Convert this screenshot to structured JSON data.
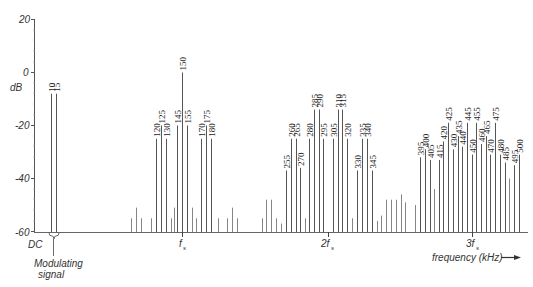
{
  "chart_data": {
    "type": "bar",
    "title": "",
    "xlabel": "frequency (kHz)",
    "ylabel": "dB",
    "ylim": [
      -60,
      20
    ],
    "yticks": [
      20,
      0,
      -20,
      -40,
      -60
    ],
    "x_markers": [
      "DC",
      "fs",
      "2fs",
      "3fs"
    ],
    "annotation": "Modulating signal",
    "grid": false,
    "series": [
      {
        "name": "Modulating signal",
        "points": [
          {
            "x": 10,
            "y": -8,
            "label": "10"
          },
          {
            "x": 15,
            "y": -8,
            "label": "15"
          }
        ]
      },
      {
        "name": "Sidebands around fs",
        "points": [
          {
            "x": 120,
            "y": -25,
            "label": "120"
          },
          {
            "x": 125,
            "y": -20,
            "label": "125"
          },
          {
            "x": 130,
            "y": -25,
            "label": "130"
          },
          {
            "x": 145,
            "y": -20,
            "label": "145"
          },
          {
            "x": 150,
            "y": 0,
            "label": "150"
          },
          {
            "x": 155,
            "y": -20,
            "label": "155"
          },
          {
            "x": 170,
            "y": -25,
            "label": "170"
          },
          {
            "x": 175,
            "y": -20,
            "label": "175"
          },
          {
            "x": 180,
            "y": -25,
            "label": "180"
          }
        ]
      },
      {
        "name": "Sidebands around 2fs",
        "points": [
          {
            "x": 255,
            "y": -37,
            "label": "255"
          },
          {
            "x": 260,
            "y": -25,
            "label": "260"
          },
          {
            "x": 265,
            "y": -25,
            "label": "265"
          },
          {
            "x": 270,
            "y": -36,
            "label": "270"
          },
          {
            "x": 280,
            "y": -25,
            "label": "280"
          },
          {
            "x": 285,
            "y": -14,
            "label": "285"
          },
          {
            "x": 290,
            "y": -14,
            "label": "290"
          },
          {
            "x": 295,
            "y": -25,
            "label": "295"
          },
          {
            "x": 305,
            "y": -25,
            "label": "305"
          },
          {
            "x": 310,
            "y": -14,
            "label": "310"
          },
          {
            "x": 315,
            "y": -14,
            "label": "315"
          },
          {
            "x": 320,
            "y": -25,
            "label": "320"
          },
          {
            "x": 330,
            "y": -37,
            "label": "330"
          },
          {
            "x": 335,
            "y": -25,
            "label": "335"
          },
          {
            "x": 340,
            "y": -25,
            "label": "340"
          },
          {
            "x": 345,
            "y": -37,
            "label": "345"
          }
        ]
      },
      {
        "name": "Sidebands around 3fs",
        "points": [
          {
            "x": 395,
            "y": -32,
            "label": "395"
          },
          {
            "x": 400,
            "y": -29,
            "label": "400"
          },
          {
            "x": 405,
            "y": -33,
            "label": "405"
          },
          {
            "x": 415,
            "y": -33,
            "label": "415"
          },
          {
            "x": 420,
            "y": -26,
            "label": "420"
          },
          {
            "x": 425,
            "y": -19,
            "label": "425"
          },
          {
            "x": 430,
            "y": -29,
            "label": "430"
          },
          {
            "x": 435,
            "y": -24,
            "label": "435"
          },
          {
            "x": 440,
            "y": -28,
            "label": "440"
          },
          {
            "x": 445,
            "y": -19,
            "label": "445"
          },
          {
            "x": 450,
            "y": -31,
            "label": "450"
          },
          {
            "x": 455,
            "y": -19,
            "label": "455"
          },
          {
            "x": 460,
            "y": -27,
            "label": "460"
          },
          {
            "x": 465,
            "y": -24,
            "label": "465"
          },
          {
            "x": 470,
            "y": -31,
            "label": "470"
          },
          {
            "x": 475,
            "y": -19,
            "label": "475"
          },
          {
            "x": 480,
            "y": -31,
            "label": "480"
          },
          {
            "x": 485,
            "y": -34,
            "label": "485"
          },
          {
            "x": 495,
            "y": -35,
            "label": "495"
          },
          {
            "x": 500,
            "y": -31,
            "label": "500"
          }
        ]
      }
    ],
    "minor_components_note": "unlabeled low-level lines between -60 and -46 dB throughout"
  },
  "render": {
    "labeled": [
      {
        "px": 51,
        "dB": -8,
        "t": "10"
      },
      {
        "px": 56,
        "dB": -8,
        "t": "15"
      },
      {
        "px": 156,
        "dB": -25,
        "t": "120"
      },
      {
        "px": 161,
        "dB": -20,
        "t": "125"
      },
      {
        "px": 166,
        "dB": -25,
        "t": "130"
      },
      {
        "px": 177,
        "dB": -20,
        "t": "145"
      },
      {
        "px": 182,
        "dB": 0,
        "t": "150"
      },
      {
        "px": 187,
        "dB": -20,
        "t": "155"
      },
      {
        "px": 201,
        "dB": -25,
        "t": "170"
      },
      {
        "px": 206,
        "dB": -20,
        "t": "175"
      },
      {
        "px": 211,
        "dB": -25,
        "t": "180"
      },
      {
        "px": 286,
        "dB": -37,
        "t": "255"
      },
      {
        "px": 291,
        "dB": -25,
        "t": "260"
      },
      {
        "px": 296,
        "dB": -25,
        "t": "265"
      },
      {
        "px": 300,
        "dB": -36,
        "t": "270"
      },
      {
        "px": 309,
        "dB": -25,
        "t": "280"
      },
      {
        "px": 314,
        "dB": -14,
        "t": "285"
      },
      {
        "px": 319,
        "dB": -14,
        "t": "290"
      },
      {
        "px": 323,
        "dB": -25,
        "t": "295"
      },
      {
        "px": 333,
        "dB": -25,
        "t": "305"
      },
      {
        "px": 338,
        "dB": -14,
        "t": "310"
      },
      {
        "px": 342,
        "dB": -14,
        "t": "315"
      },
      {
        "px": 347,
        "dB": -25,
        "t": "320"
      },
      {
        "px": 357,
        "dB": -37,
        "t": "330"
      },
      {
        "px": 362,
        "dB": -25,
        "t": "335"
      },
      {
        "px": 367,
        "dB": -25,
        "t": "340"
      },
      {
        "px": 372,
        "dB": -37,
        "t": "345"
      },
      {
        "px": 420,
        "dB": -32,
        "t": "395"
      },
      {
        "px": 425,
        "dB": -29,
        "t": "400"
      },
      {
        "px": 430,
        "dB": -33,
        "t": "405"
      },
      {
        "px": 439,
        "dB": -33,
        "t": "415"
      },
      {
        "px": 443,
        "dB": -26,
        "t": "420"
      },
      {
        "px": 448,
        "dB": -19,
        "t": "425"
      },
      {
        "px": 453,
        "dB": -29,
        "t": "430"
      },
      {
        "px": 458,
        "dB": -24,
        "t": "435"
      },
      {
        "px": 462,
        "dB": -28,
        "t": "440"
      },
      {
        "px": 467,
        "dB": -19,
        "t": "445"
      },
      {
        "px": 472,
        "dB": -31,
        "t": "450"
      },
      {
        "px": 476,
        "dB": -19,
        "t": "455"
      },
      {
        "px": 481,
        "dB": -27,
        "t": "460"
      },
      {
        "px": 486,
        "dB": -24,
        "t": "465"
      },
      {
        "px": 490,
        "dB": -31,
        "t": "470"
      },
      {
        "px": 495,
        "dB": -19,
        "t": "475"
      },
      {
        "px": 500,
        "dB": -31,
        "t": "480"
      },
      {
        "px": 505,
        "dB": -34,
        "t": "485"
      },
      {
        "px": 514,
        "dB": -35,
        "t": "495"
      },
      {
        "px": 519,
        "dB": -31,
        "t": "500"
      }
    ],
    "minor": [
      {
        "px": 131,
        "dB": -55
      },
      {
        "px": 136,
        "dB": -51
      },
      {
        "px": 141,
        "dB": -55
      },
      {
        "px": 151,
        "dB": -55
      },
      {
        "px": 171,
        "dB": -55
      },
      {
        "px": 174,
        "dB": -51
      },
      {
        "px": 192,
        "dB": -51
      },
      {
        "px": 196,
        "dB": -55
      },
      {
        "px": 218,
        "dB": -55
      },
      {
        "px": 227,
        "dB": -55
      },
      {
        "px": 232,
        "dB": -51
      },
      {
        "px": 237,
        "dB": -55
      },
      {
        "px": 262,
        "dB": -55
      },
      {
        "px": 266,
        "dB": -48
      },
      {
        "px": 271,
        "dB": -48
      },
      {
        "px": 276,
        "dB": -55
      },
      {
        "px": 281,
        "dB": -57
      },
      {
        "px": 305,
        "dB": -55
      },
      {
        "px": 352,
        "dB": -55
      },
      {
        "px": 377,
        "dB": -56
      },
      {
        "px": 381,
        "dB": -54
      },
      {
        "px": 386,
        "dB": -48
      },
      {
        "px": 391,
        "dB": -48
      },
      {
        "px": 396,
        "dB": -48
      },
      {
        "px": 401,
        "dB": -46
      },
      {
        "px": 405,
        "dB": -49
      },
      {
        "px": 415,
        "dB": -50
      },
      {
        "px": 434,
        "dB": -44
      },
      {
        "px": 509,
        "dB": -40
      }
    ]
  },
  "labels": {
    "ylabel": "dB",
    "y20": "20",
    "y0": "0",
    "ym20": "-20",
    "ym40": "-40",
    "ym60": "-60",
    "dc": "DC",
    "mod1": "Modulating",
    "mod2": "signal",
    "fs": "f",
    "fs_sub": "s",
    "fs2": "2f",
    "fs3": "3f",
    "xlabel": "frequency (kHz)"
  }
}
